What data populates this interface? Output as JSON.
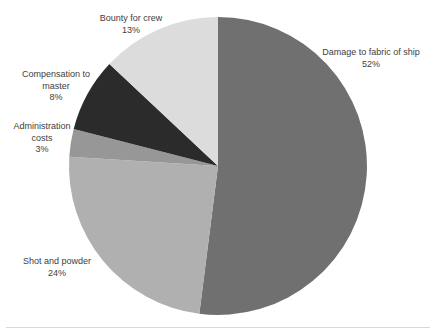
{
  "chart_data": {
    "type": "pie",
    "title": "",
    "legend": "none",
    "labels_position": "outside",
    "start_angle_deg": 0,
    "direction": "clockwise",
    "background_color": "#ffffff",
    "label_text_color": "#3e3e3e",
    "slices": [
      {
        "label": "Damage to fabric of ship",
        "value": 52,
        "pct_label": "52%",
        "color": "#707070"
      },
      {
        "label": "Shot and powder",
        "value": 24,
        "pct_label": "24%",
        "color": "#b0b0b0"
      },
      {
        "label": "Administration costs",
        "value": 3,
        "pct_label": "3%",
        "color": "#979797"
      },
      {
        "label": "Compensation to master",
        "value": 8,
        "pct_label": "8%",
        "color": "#2b2b2b"
      },
      {
        "label": "Bounty for crew",
        "value": 13,
        "pct_label": "13%",
        "color": "#dcdcdc"
      }
    ]
  }
}
